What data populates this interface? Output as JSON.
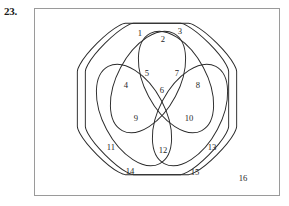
{
  "problem": {
    "number": "23."
  },
  "figure": {
    "type": "venn-diagram-4-sets",
    "frame": {
      "x": 34,
      "y": 8,
      "width": 246,
      "height": 188,
      "border_color": "#9a9a9a"
    },
    "stroke_color": "#2a2a2a",
    "background_color": "#ffffff",
    "region_labels": [
      {
        "text": "1",
        "x": 105,
        "y": 25
      },
      {
        "text": "2",
        "x": 128,
        "y": 31
      },
      {
        "text": "3",
        "x": 145,
        "y": 23
      },
      {
        "text": "4",
        "x": 91,
        "y": 77
      },
      {
        "text": "5",
        "x": 112,
        "y": 65
      },
      {
        "text": "6",
        "x": 127,
        "y": 82
      },
      {
        "text": "7",
        "x": 142,
        "y": 65
      },
      {
        "text": "8",
        "x": 163,
        "y": 77
      },
      {
        "text": "9",
        "x": 101,
        "y": 110
      },
      {
        "text": "10",
        "x": 154,
        "y": 110
      },
      {
        "text": "11",
        "x": 76,
        "y": 139
      },
      {
        "text": "12",
        "x": 128,
        "y": 142
      },
      {
        "text": "13",
        "x": 177,
        "y": 139
      },
      {
        "text": "14",
        "x": 95,
        "y": 163
      },
      {
        "text": "15",
        "x": 160,
        "y": 164
      },
      {
        "text": "16",
        "x": 208,
        "y": 170
      }
    ],
    "set_shapes": [
      {
        "name": "outer-rounded-square-left",
        "kind": "squircle",
        "cx": 118,
        "cy": 90,
        "r": 79,
        "rotation": 45
      },
      {
        "name": "outer-rounded-square-right",
        "kind": "squircle",
        "cx": 138,
        "cy": 90,
        "r": 79,
        "rotation": 45
      },
      {
        "name": "ellipse-top-left",
        "kind": "ellipse",
        "cx": 113,
        "cy": 72,
        "rx": 32,
        "ry": 55,
        "rotation": 25
      },
      {
        "name": "ellipse-top-right",
        "kind": "ellipse",
        "cx": 142,
        "cy": 72,
        "rx": 32,
        "ry": 55,
        "rotation": -25
      },
      {
        "name": "ellipse-bottom-left",
        "kind": "ellipse",
        "cx": 100,
        "cy": 108,
        "rx": 32,
        "ry": 55,
        "rotation": -25
      },
      {
        "name": "ellipse-bottom-right",
        "kind": "ellipse",
        "cx": 155,
        "cy": 108,
        "rx": 32,
        "ry": 55,
        "rotation": 25
      }
    ]
  }
}
